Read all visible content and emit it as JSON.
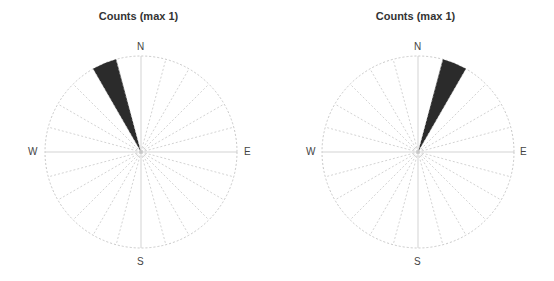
{
  "chart_data": [
    {
      "type": "rose",
      "title": "Counts (max 1)",
      "direction_labels": [
        "N",
        "E",
        "S",
        "W"
      ],
      "bin_width_deg": 15,
      "bins_deg": [
        0,
        15,
        30,
        45,
        60,
        75,
        90,
        105,
        120,
        135,
        150,
        165,
        180,
        195,
        210,
        225,
        240,
        255,
        270,
        285,
        300,
        315,
        330,
        345
      ],
      "values": [
        0,
        0,
        0,
        0,
        0,
        0,
        0,
        0,
        0,
        0,
        0,
        0,
        0,
        0,
        0,
        0,
        0,
        0,
        0,
        0,
        0,
        0,
        1,
        0
      ],
      "max_count": 1,
      "filled_sector": {
        "from_deg": 330,
        "to_deg": 345,
        "count": 1
      },
      "fill_color": "#2b2b2b",
      "grid_color": "#c8c8c8"
    },
    {
      "type": "rose",
      "title": "Counts (max 1)",
      "direction_labels": [
        "N",
        "E",
        "S",
        "W"
      ],
      "bin_width_deg": 15,
      "bins_deg": [
        0,
        15,
        30,
        45,
        60,
        75,
        90,
        105,
        120,
        135,
        150,
        165,
        180,
        195,
        210,
        225,
        240,
        255,
        270,
        285,
        300,
        315,
        330,
        345
      ],
      "values": [
        0,
        1,
        0,
        0,
        0,
        0,
        0,
        0,
        0,
        0,
        0,
        0,
        0,
        0,
        0,
        0,
        0,
        0,
        0,
        0,
        0,
        0,
        0,
        0
      ],
      "max_count": 1,
      "filled_sector": {
        "from_deg": 15,
        "to_deg": 30,
        "count": 1
      },
      "fill_color": "#2b2b2b",
      "grid_color": "#c8c8c8"
    }
  ],
  "plots": [
    {
      "title": "Counts (max 1)",
      "n": "N",
      "e": "E",
      "s": "S",
      "w": "W"
    },
    {
      "title": "Counts (max 1)",
      "n": "N",
      "e": "E",
      "s": "S",
      "w": "W"
    }
  ]
}
